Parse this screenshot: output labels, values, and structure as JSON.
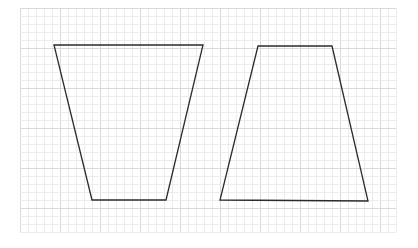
{
  "canvas": {
    "width": 418,
    "height": 248,
    "background": "#ffffff"
  },
  "grid": {
    "x0": 20,
    "y0": 8,
    "x1": 401,
    "y1": 236,
    "spacing": 8,
    "major_every": 5,
    "minor_color": "#ececec",
    "major_color": "#d9d9d9"
  },
  "shapes": [
    {
      "name": "inverted-trapezoid",
      "stroke": "#2b2b2b",
      "stroke_width": 1.3,
      "points": [
        [
          54,
          45
        ],
        [
          203,
          45
        ],
        [
          166,
          200
        ],
        [
          92,
          200
        ]
      ]
    },
    {
      "name": "trapezoid",
      "stroke": "#2b2b2b",
      "stroke_width": 1.3,
      "points": [
        [
          258,
          46
        ],
        [
          332,
          46
        ],
        [
          368,
          201
        ],
        [
          220,
          200
        ]
      ]
    }
  ]
}
